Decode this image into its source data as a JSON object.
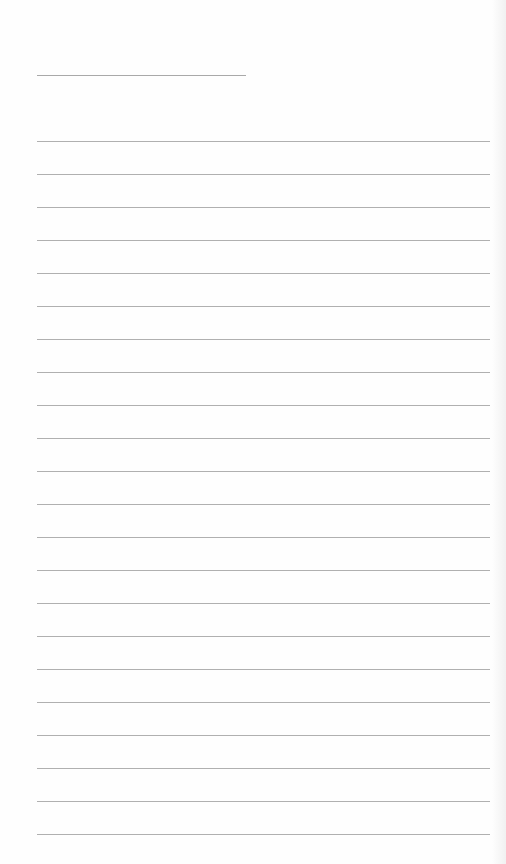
{
  "page": {
    "type": "lined-paper",
    "background_color": "#fefefe",
    "line_color": "#b0b0b0"
  },
  "header_line": {
    "label": "",
    "top": 75,
    "left": 37,
    "width": 209
  },
  "ruled_lines": {
    "count": 22,
    "first_top": 141,
    "spacing": 33,
    "left": 37,
    "width": 453,
    "text": [
      "",
      "",
      "",
      "",
      "",
      "",
      "",
      "",
      "",
      "",
      "",
      "",
      "",
      "",
      "",
      "",
      "",
      "",
      "",
      "",
      "",
      ""
    ]
  }
}
